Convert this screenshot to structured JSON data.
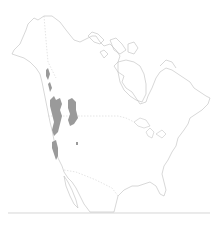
{
  "map": {
    "region": "North America",
    "type": "species range map",
    "range_description": "Shaded range in western North America (Pacific Northwest: British Columbia, Washington, Oregon, Idaho, western Montana, Alberta Rockies, northern California)",
    "colors": {
      "background": "#ffffff",
      "outline": "#bdbdbd",
      "range_fill": "#9a9a9a",
      "baseline": "#c4c4c4"
    },
    "legend": null,
    "labels": []
  }
}
